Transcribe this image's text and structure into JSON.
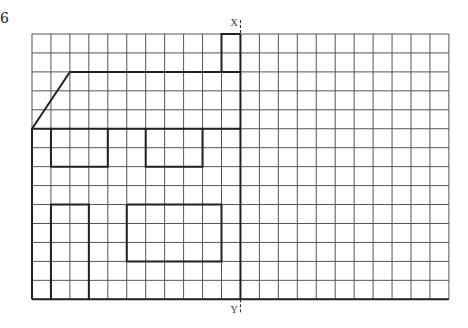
{
  "question_number": "6",
  "grid": {
    "origin_x": 32,
    "origin_y": 34,
    "cell": 18.95,
    "cols": 22,
    "rows": 14,
    "line_color": "#555555",
    "shape_color": "#222222"
  },
  "axis": {
    "col": 11,
    "top_label": "X",
    "bottom_label": "Y"
  },
  "shape": {
    "polylines": [
      [
        [
          0,
          14
        ],
        [
          0,
          5
        ],
        [
          2,
          2
        ],
        [
          11,
          2
        ]
      ],
      [
        [
          0,
          5
        ],
        [
          11,
          5
        ]
      ],
      [
        [
          10,
          2
        ],
        [
          10,
          0
        ],
        [
          11,
          0
        ]
      ],
      [
        [
          1,
          5
        ],
        [
          1,
          7
        ],
        [
          4,
          7
        ],
        [
          4,
          5
        ]
      ],
      [
        [
          6,
          5
        ],
        [
          6,
          7
        ],
        [
          9,
          7
        ],
        [
          9,
          5
        ]
      ],
      [
        [
          1,
          14
        ],
        [
          1,
          9
        ],
        [
          3,
          9
        ],
        [
          3,
          14
        ]
      ],
      [
        [
          5,
          9
        ],
        [
          10,
          9
        ],
        [
          10,
          12
        ],
        [
          5,
          12
        ],
        [
          5,
          9
        ]
      ],
      [
        [
          0,
          14
        ],
        [
          22,
          14
        ]
      ]
    ]
  }
}
